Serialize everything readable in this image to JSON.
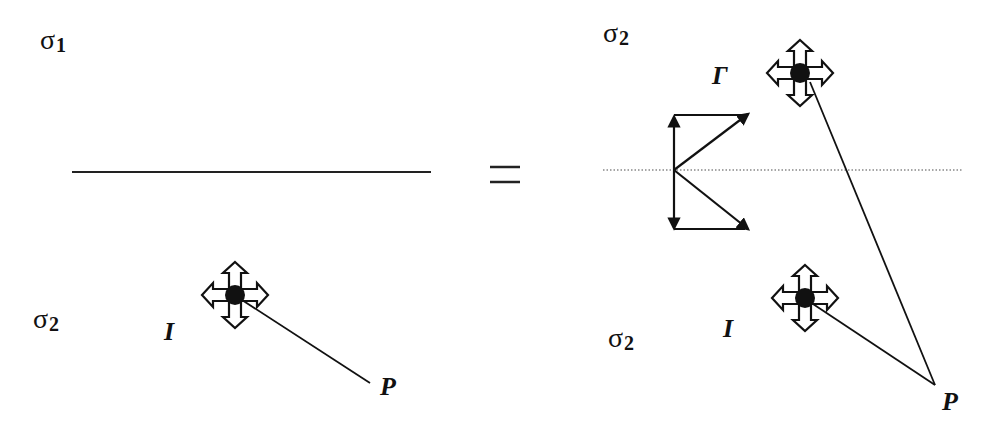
{
  "left_panel": {
    "top_medium_label": {
      "symbol": "σ",
      "subscript": "1"
    },
    "bottom_medium_label": {
      "symbol": "σ",
      "subscript": "2"
    },
    "interface_line": "solid",
    "source_label": "I",
    "point_label": "P"
  },
  "equals_sign": "=",
  "right_panel": {
    "top_medium_label": {
      "symbol": "σ",
      "subscript": "2"
    },
    "bottom_medium_label": {
      "symbol": "σ",
      "subscript": "2"
    },
    "interface_line": "dotted",
    "image_source_label": "Γ",
    "source_label": "I",
    "point_label": "P",
    "symmetry_glyph": "mirrored arrow pairs"
  },
  "colors": {
    "stroke": "#111111",
    "dotted_line": "#888888",
    "background": "#ffffff"
  }
}
